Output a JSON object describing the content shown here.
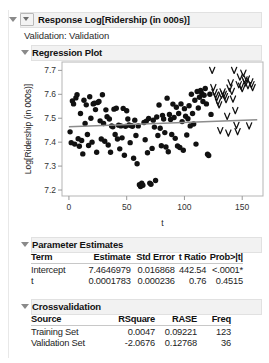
{
  "panel": {
    "response": {
      "label": "Response Log[Ridership (in 000s)]",
      "disclosure_icon": "triangle-down-icon",
      "nested_disclosure_icon": "triangle-down-boxed-icon"
    },
    "validation_line": "Validation: Validation",
    "regression_plot": {
      "label": "Regression Plot",
      "disclosure_icon": "triangle-down-icon"
    },
    "parameter_estimates": {
      "label": "Parameter Estimates",
      "disclosure_icon": "triangle-down-icon",
      "columns": [
        "Term",
        "Estimate",
        "Std Error",
        "t Ratio",
        "Prob>|t|"
      ],
      "rows": [
        {
          "term": "Intercept",
          "estimate": "7.4646979",
          "std_error": "0.016868",
          "t_ratio": "442.54",
          "prob": "<.0001*",
          "prob_significant": true
        },
        {
          "term": "t",
          "estimate": "0.0001783",
          "std_error": "0.000236",
          "t_ratio": "0.76",
          "prob": "0.4515",
          "prob_significant": false
        }
      ]
    },
    "crossvalidation": {
      "label": "Crossvalidation",
      "disclosure_icon": "triangle-down-icon",
      "columns": [
        "Source",
        "RSquare",
        "RASE",
        "Freq"
      ],
      "rows": [
        {
          "source": "Training Set",
          "rsquare": "0.0047",
          "rase": "0.09221",
          "freq": "123"
        },
        {
          "source": "Validation Set",
          "rsquare": "-2.0676",
          "rase": "0.12768",
          "freq": "36"
        }
      ]
    }
  },
  "colors": {
    "significant_pvalue": "#9aa7c4",
    "header_bar": "#f2f2f2",
    "point_fill": "#111111",
    "fit_line": "#8c8c8c",
    "axis": "#999999"
  },
  "chart_data": {
    "type": "scatter",
    "title": "Regression Plot",
    "xlabel": "t",
    "ylabel": "Log[Ridership (in 000s)]",
    "xlim": [
      -6,
      168
    ],
    "ylim": [
      7.175,
      7.735
    ],
    "xticks": [
      0,
      50,
      100,
      150
    ],
    "yticks": [
      7.2,
      7.3,
      7.4,
      7.5,
      7.6,
      7.7
    ],
    "grid": false,
    "legend": null,
    "fit_line": {
      "name": "Linear fit",
      "intercept": 7.4646979,
      "slope": 0.0001783,
      "x_start": 0,
      "x_end": 163,
      "color": "#8c8c8c"
    },
    "series": [
      {
        "name": "Training Set",
        "marker": "filled-circle",
        "color": "#111111",
        "points": [
          [
            1,
            7.443
          ],
          [
            2,
            7.398
          ],
          [
            3,
            7.572
          ],
          [
            4,
            7.56
          ],
          [
            5,
            7.392
          ],
          [
            6,
            7.585
          ],
          [
            7,
            7.598
          ],
          [
            8,
            7.414
          ],
          [
            9,
            7.383
          ],
          [
            10,
            7.52
          ],
          [
            11,
            7.407
          ],
          [
            12,
            7.351
          ],
          [
            13,
            7.575
          ],
          [
            14,
            7.478
          ],
          [
            15,
            7.556
          ],
          [
            16,
            7.432
          ],
          [
            17,
            7.386
          ],
          [
            18,
            7.59
          ],
          [
            19,
            7.5
          ],
          [
            20,
            7.4
          ],
          [
            21,
            7.56
          ],
          [
            22,
            7.563
          ],
          [
            23,
            7.536
          ],
          [
            24,
            7.358
          ],
          [
            25,
            7.566
          ],
          [
            26,
            7.57
          ],
          [
            27,
            7.489
          ],
          [
            28,
            7.413
          ],
          [
            29,
            7.598
          ],
          [
            30,
            7.478
          ],
          [
            31,
            7.404
          ],
          [
            32,
            7.535
          ],
          [
            33,
            7.506
          ],
          [
            34,
            7.388
          ],
          [
            35,
            7.497
          ],
          [
            36,
            7.358
          ],
          [
            37,
            7.468
          ],
          [
            38,
            7.464
          ],
          [
            39,
            7.538
          ],
          [
            40,
            7.432
          ],
          [
            41,
            7.542
          ],
          [
            42,
            7.413
          ],
          [
            43,
            7.471
          ],
          [
            44,
            7.372
          ],
          [
            45,
            7.468
          ],
          [
            46,
            7.418
          ],
          [
            47,
            7.541
          ],
          [
            48,
            7.345
          ],
          [
            49,
            7.466
          ],
          [
            50,
            7.531
          ],
          [
            51,
            7.497
          ],
          [
            52,
            7.472
          ],
          [
            53,
            7.398
          ],
          [
            54,
            7.469
          ],
          [
            55,
            7.466
          ],
          [
            56,
            7.333
          ],
          [
            57,
            7.492
          ],
          [
            58,
            7.428
          ],
          [
            59,
            7.31
          ],
          [
            60,
            7.468
          ],
          [
            61,
            7.222
          ],
          [
            62,
            7.215
          ],
          [
            63,
            7.228
          ],
          [
            64,
            7.22
          ],
          [
            65,
            7.482
          ],
          [
            66,
            7.41
          ],
          [
            67,
            7.488
          ],
          [
            68,
            7.356
          ],
          [
            69,
            7.499
          ],
          [
            70,
            7.229
          ],
          [
            71,
            7.224
          ],
          [
            72,
            7.374
          ],
          [
            73,
            7.492
          ],
          [
            74,
            7.463
          ],
          [
            75,
            7.24
          ],
          [
            76,
            7.505
          ],
          [
            77,
            7.428
          ],
          [
            78,
            7.555
          ],
          [
            79,
            7.458
          ],
          [
            80,
            7.385
          ],
          [
            81,
            7.512
          ],
          [
            82,
            7.497
          ],
          [
            83,
            7.44
          ],
          [
            84,
            7.38
          ],
          [
            85,
            7.584
          ],
          [
            86,
            7.36
          ],
          [
            87,
            7.516
          ],
          [
            88,
            7.495
          ],
          [
            89,
            7.432
          ],
          [
            90,
            7.559
          ],
          [
            91,
            7.503
          ],
          [
            92,
            7.416
          ],
          [
            93,
            7.546
          ],
          [
            94,
            7.384
          ],
          [
            95,
            7.52
          ],
          [
            96,
            7.378
          ],
          [
            97,
            7.56
          ],
          [
            98,
            7.486
          ],
          [
            99,
            7.366
          ],
          [
            100,
            7.54
          ],
          [
            101,
            7.508
          ],
          [
            102,
            7.43
          ],
          [
            103,
            7.498
          ],
          [
            104,
            7.552
          ],
          [
            105,
            7.468
          ],
          [
            106,
            7.6
          ],
          [
            107,
            7.52
          ],
          [
            108,
            7.476
          ],
          [
            109,
            7.575
          ],
          [
            110,
            7.392
          ],
          [
            111,
            7.612
          ],
          [
            112,
            7.543
          ],
          [
            113,
            7.588
          ],
          [
            114,
            7.616
          ],
          [
            115,
            7.604
          ],
          [
            116,
            7.57
          ],
          [
            117,
            7.596
          ],
          [
            118,
            7.624
          ],
          [
            119,
            7.56
          ],
          [
            120,
            7.35
          ],
          [
            121,
            7.344
          ],
          [
            122,
            7.6
          ],
          [
            123,
            7.516
          ]
        ]
      },
      {
        "name": "Validation Set",
        "marker": "v-glyph",
        "color": "#111111",
        "points": [
          [
            124,
            7.7
          ],
          [
            125,
            7.628
          ],
          [
            126,
            7.608
          ],
          [
            127,
            7.596
          ],
          [
            128,
            7.586
          ],
          [
            129,
            7.568
          ],
          [
            130,
            7.556
          ],
          [
            131,
            7.448
          ],
          [
            132,
            7.596
          ],
          [
            133,
            7.61
          ],
          [
            134,
            7.6
          ],
          [
            135,
            7.59
          ],
          [
            136,
            7.578
          ],
          [
            137,
            7.508
          ],
          [
            138,
            7.438
          ],
          [
            139,
            7.626
          ],
          [
            140,
            7.648
          ],
          [
            141,
            7.612
          ],
          [
            142,
            7.58
          ],
          [
            143,
            7.7
          ],
          [
            144,
            7.532
          ],
          [
            145,
            7.47
          ],
          [
            146,
            7.444
          ],
          [
            147,
            7.64
          ],
          [
            148,
            7.672
          ],
          [
            149,
            7.634
          ],
          [
            150,
            7.624
          ],
          [
            151,
            7.688
          ],
          [
            152,
            7.66
          ],
          [
            153,
            7.648
          ],
          [
            154,
            7.664
          ],
          [
            155,
            7.636
          ],
          [
            156,
            7.468
          ],
          [
            157,
            7.652
          ],
          [
            158,
            7.64
          ],
          [
            159,
            7.628
          ]
        ]
      }
    ]
  }
}
